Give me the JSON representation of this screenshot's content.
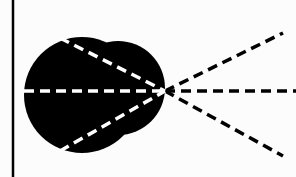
{
  "diagram": {
    "background": "#fcfcfc",
    "ink": "#000000",
    "inner_dash": "#ffffff",
    "vertical_line": {
      "x": 13,
      "y1": 0,
      "y2": 177
    },
    "blob": {
      "circles": [
        {
          "cx": 82,
          "cy": 95,
          "r": 58
        },
        {
          "cx": 118,
          "cy": 88,
          "r": 47
        }
      ]
    },
    "focal_point": {
      "x": 165,
      "y": 91
    },
    "rays": [
      {
        "name": "upper",
        "start": [
          60,
          38
        ],
        "end": [
          283,
          33
        ]
      },
      {
        "name": "middle",
        "start": [
          24,
          91
        ],
        "end": [
          296,
          91
        ]
      },
      {
        "name": "lower",
        "start": [
          60,
          151
        ],
        "end": [
          283,
          156
        ]
      }
    ]
  }
}
